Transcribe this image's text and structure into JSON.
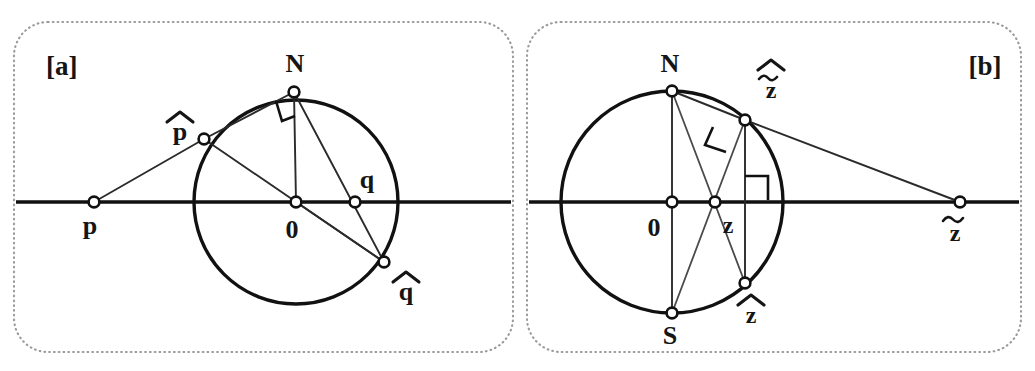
{
  "figure": {
    "background_color": "#ffffff",
    "ink_color": "#151515",
    "frame_color": "#9a9a9a",
    "panels": [
      {
        "id": "a",
        "label": "[a]",
        "label_position": "top-left",
        "frame": {
          "x": 14,
          "y": 22,
          "width": 499,
          "height": 330,
          "radius": 34,
          "style": "dotted"
        },
        "axis": {
          "label": "real-axis",
          "y": 202,
          "x_start": 16,
          "x_end": 511
        },
        "circle": {
          "cx": 296,
          "cy": 202,
          "r": 102
        },
        "points": [
          {
            "name": "p",
            "label": "p",
            "x": 94,
            "y": 202,
            "label_x": 90,
            "label_y": 232,
            "on_circle": false
          },
          {
            "name": "p-hat",
            "label": "p",
            "accent": "hat",
            "x": 204,
            "y": 139,
            "label_x": 178,
            "label_y": 131,
            "on_circle": true
          },
          {
            "name": "N",
            "label": "N",
            "x": 294,
            "y": 92,
            "label_x": 294,
            "label_y": 70,
            "on_circle": true
          },
          {
            "name": "origin",
            "label": "0",
            "x": 296,
            "y": 202,
            "label_x": 292,
            "label_y": 236,
            "on_circle": false
          },
          {
            "name": "q",
            "label": "q",
            "x": 355,
            "y": 202,
            "label_x": 364,
            "label_y": 185,
            "on_circle": false
          },
          {
            "name": "q-hat",
            "label": "q",
            "accent": "hat",
            "x": 384,
            "y": 262,
            "label_x": 404,
            "label_y": 296,
            "on_circle": true
          }
        ],
        "segments": [
          {
            "from": "p",
            "to": "p-hat"
          },
          {
            "from": "p-hat",
            "to": "N"
          },
          {
            "from": "p-hat",
            "to": "q-hat"
          },
          {
            "from": "N",
            "to": "origin"
          },
          {
            "from": "N",
            "to": "q-hat"
          },
          {
            "from": "origin",
            "to": "q-hat"
          }
        ],
        "right_angles": [
          {
            "at": "N",
            "size": 18,
            "note": "right angle between N-origin and N-p-hat"
          }
        ]
      },
      {
        "id": "b",
        "label": "[b]",
        "label_position": "top-right",
        "frame": {
          "x": 527,
          "y": 22,
          "width": 494,
          "height": 330,
          "radius": 34,
          "style": "dotted"
        },
        "axis": {
          "label": "real-axis",
          "y": 202,
          "x_start": 529,
          "x_end": 1019
        },
        "circle": {
          "cx": 672,
          "cy": 202,
          "r": 111
        },
        "points": [
          {
            "name": "N",
            "label": "N",
            "x": 672,
            "y": 91,
            "label_x": 668,
            "label_y": 70,
            "on_circle": true
          },
          {
            "name": "origin",
            "label": "0",
            "x": 672,
            "y": 202,
            "label_x": 655,
            "label_y": 234,
            "on_circle": false
          },
          {
            "name": "S",
            "label": "S",
            "x": 672,
            "y": 313,
            "label_x": 668,
            "label_y": 342,
            "on_circle": true
          },
          {
            "name": "z",
            "label": "z",
            "x": 715,
            "y": 202,
            "label_x": 726,
            "label_y": 232,
            "on_circle": false
          },
          {
            "name": "z-hat-tilde",
            "label": "z",
            "accent": "hat-tilde",
            "x": 745,
            "y": 120,
            "label_x": 768,
            "label_y": 95,
            "on_circle": true
          },
          {
            "name": "z-hat",
            "label": "z",
            "accent": "hat",
            "x": 745,
            "y": 283,
            "label_x": 748,
            "label_y": 320,
            "on_circle": true
          },
          {
            "name": "z-tilde",
            "label": "z",
            "accent": "tilde",
            "x": 960,
            "y": 202,
            "label_x": 952,
            "label_y": 238,
            "on_circle": false
          }
        ],
        "segments": [
          {
            "from": "N",
            "to": "S"
          },
          {
            "from": "N",
            "to": "z-hat"
          },
          {
            "from": "N",
            "to": "z-hat-tilde"
          },
          {
            "from": "z-hat-tilde",
            "to": "z-tilde"
          },
          {
            "from": "S",
            "to": "z-hat-tilde"
          },
          {
            "from": "z-hat-tilde",
            "to": "z-hat"
          }
        ],
        "right_angles": [
          {
            "at": "z-hat-tilde",
            "size": 18,
            "note": "right angle at z-hat-tilde between N-ray and tangent"
          },
          {
            "at": "z",
            "size": 16,
            "note": "right angle where vertical chord meets the real axis"
          }
        ]
      }
    ]
  }
}
